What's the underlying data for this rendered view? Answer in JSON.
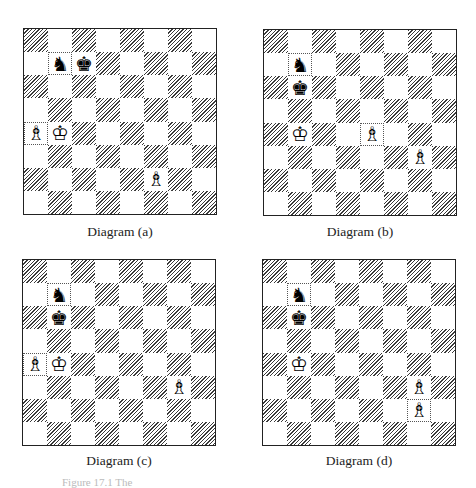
{
  "diagrams": [
    {
      "id": "a",
      "caption": "Diagram (a)",
      "pieces": [
        {
          "square": "b7",
          "piece": "black-knight",
          "glyph": "♞"
        },
        {
          "square": "c7",
          "piece": "black-king",
          "glyph": "♚"
        },
        {
          "square": "a4",
          "piece": "white-bishop",
          "glyph": "♗"
        },
        {
          "square": "b4",
          "piece": "white-king",
          "glyph": "♔"
        },
        {
          "square": "f2",
          "piece": "white-bishop",
          "glyph": "♗"
        }
      ]
    },
    {
      "id": "b",
      "caption": "Diagram (b)",
      "pieces": [
        {
          "square": "b7",
          "piece": "black-knight",
          "glyph": "♞"
        },
        {
          "square": "b6",
          "piece": "black-king",
          "glyph": "♚"
        },
        {
          "square": "b4",
          "piece": "white-king",
          "glyph": "♔"
        },
        {
          "square": "e4",
          "piece": "white-bishop",
          "glyph": "♗"
        },
        {
          "square": "g3",
          "piece": "white-bishop",
          "glyph": "♗"
        }
      ]
    },
    {
      "id": "c",
      "caption": "Diagram (c)",
      "pieces": [
        {
          "square": "b7",
          "piece": "black-knight",
          "glyph": "♞"
        },
        {
          "square": "b6",
          "piece": "black-king",
          "glyph": "♚"
        },
        {
          "square": "a4",
          "piece": "white-bishop",
          "glyph": "♗"
        },
        {
          "square": "b4",
          "piece": "white-king",
          "glyph": "♔"
        },
        {
          "square": "g3",
          "piece": "white-bishop",
          "glyph": "♗"
        }
      ]
    },
    {
      "id": "d",
      "caption": "Diagram (d)",
      "pieces": [
        {
          "square": "b7",
          "piece": "black-knight",
          "glyph": "♞"
        },
        {
          "square": "b6",
          "piece": "black-king",
          "glyph": "♚"
        },
        {
          "square": "b4",
          "piece": "white-king",
          "glyph": "♔"
        },
        {
          "square": "g3",
          "piece": "white-bishop",
          "glyph": "♗"
        },
        {
          "square": "g2",
          "piece": "white-bishop",
          "glyph": "♗"
        }
      ]
    }
  ],
  "figure_caption": "Figure 17.1 The",
  "colors": {
    "dark_hatch": "#3a3a3a",
    "light": "#ffffff",
    "border": "#222222"
  }
}
